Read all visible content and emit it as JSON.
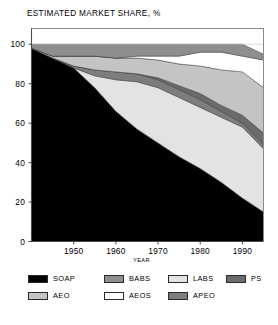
{
  "figure": {
    "title": "ESTIMATED MARKET SHARE, %",
    "background": "#ffffff"
  },
  "axes": {
    "y": {
      "label": "",
      "ticks": [
        "0",
        "20",
        "40",
        "60",
        "80",
        "100"
      ],
      "min": 0,
      "max": 100
    },
    "x": {
      "label": "YEAR",
      "ticks": [
        "1950",
        "1960",
        "1970",
        "1980",
        "1990"
      ],
      "min": 1940,
      "max": 1995
    }
  },
  "legend": {
    "rows": [
      [
        {
          "label": "SOAP",
          "color": "#000000"
        },
        {
          "label": "BABS",
          "color": "#8e8e8e"
        },
        {
          "label": "LABS",
          "color": "#e3e3e3"
        },
        {
          "label": "PS",
          "color": "#6b6b6b"
        }
      ],
      [
        {
          "label": "AEO",
          "color": "#c4c4c4"
        },
        {
          "label": "AEOS",
          "color": "#ffffff"
        },
        {
          "label": "APEO",
          "color": "#7d7d7d"
        }
      ]
    ]
  },
  "chart_data": {
    "type": "area",
    "title": "ESTIMATED MARKET SHARE, %",
    "xlabel": "YEAR",
    "ylabel": "ESTIMATED MARKET SHARE, %",
    "xlim": [
      1940,
      1995
    ],
    "ylim": [
      0,
      100
    ],
    "grid": false,
    "stacked": true,
    "legend_position": "bottom",
    "x": [
      1940,
      1945,
      1950,
      1955,
      1960,
      1965,
      1970,
      1975,
      1980,
      1985,
      1990,
      1995
    ],
    "series": [
      {
        "name": "SOAP",
        "color": "#000000",
        "values": [
          98,
          93,
          88,
          78,
          66,
          57,
          50,
          43,
          37,
          30,
          22,
          15
        ]
      },
      {
        "name": "LABS",
        "color": "#e3e3e3",
        "values": [
          0,
          0,
          0,
          6,
          16,
          24,
          28,
          30,
          31,
          33,
          36,
          32
        ]
      },
      {
        "name": "APEO",
        "color": "#7d7d7d",
        "values": [
          0,
          0,
          1,
          3,
          4,
          4,
          4,
          4,
          4,
          3,
          2,
          2
        ]
      },
      {
        "name": "PS",
        "color": "#6b6b6b",
        "values": [
          0,
          0,
          0,
          0,
          0,
          0,
          1,
          2,
          3,
          3,
          4,
          6
        ]
      },
      {
        "name": "AEO",
        "color": "#c4c4c4",
        "values": [
          0,
          1,
          5,
          7,
          7,
          8,
          9,
          11,
          14,
          18,
          22,
          23
        ]
      },
      {
        "name": "AEOS",
        "color": "#ffffff",
        "values": [
          0,
          0,
          0,
          0,
          0,
          1,
          2,
          4,
          7,
          9,
          8,
          14
        ]
      },
      {
        "name": "BABS",
        "color": "#8e8e8e",
        "values": [
          2,
          6,
          6,
          6,
          7,
          6,
          6,
          6,
          4,
          4,
          6,
          3
        ]
      }
    ]
  }
}
